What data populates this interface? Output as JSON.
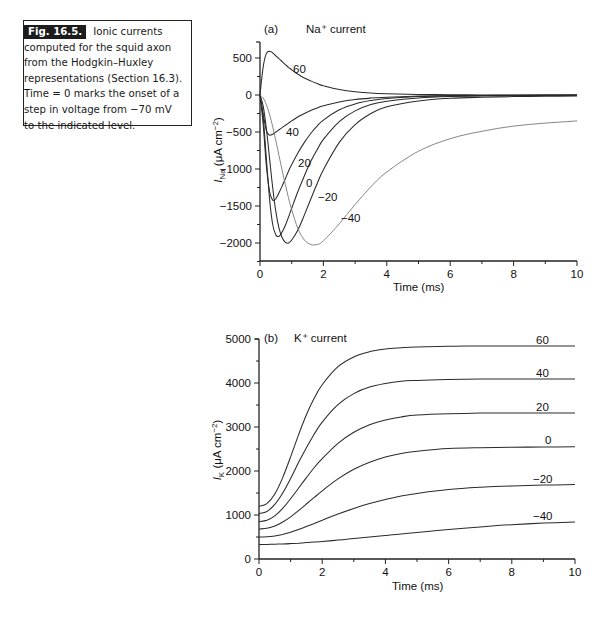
{
  "caption": {
    "figure_label": "Fig. 16.5.",
    "text": "Ionic currents computed for the squid axon from the Hodgkin–Huxley representations (Section 16.3). Time = 0 marks the onset of a step in voltage from −70 mV to the indicated level."
  },
  "chart_data": [
    {
      "id": "a",
      "type": "line",
      "panel_label": "(a)",
      "title": "Na⁺ current",
      "xlabel": "Time (ms)",
      "ylabel": "I_Na (μA cm⁻²)",
      "xlim": [
        0,
        10
      ],
      "ylim": [
        -2300,
        750
      ],
      "xticks": [
        0,
        2,
        4,
        6,
        8,
        10
      ],
      "yticks": [
        500,
        0,
        -500,
        -1000,
        -1500,
        -2000
      ],
      "grid": false,
      "legend": "inline curve labels",
      "x": [
        0,
        0.1,
        0.2,
        0.3,
        0.4,
        0.5,
        0.6,
        0.7,
        0.8,
        0.9,
        1.0,
        1.2,
        1.4,
        1.6,
        1.8,
        2.0,
        2.5,
        3.0,
        3.5,
        4.0,
        5.0,
        6.0,
        7.0,
        8.0,
        9.0,
        10.0
      ],
      "series": [
        {
          "name": "60",
          "values": [
            0,
            380,
            560,
            590,
            570,
            530,
            490,
            450,
            410,
            375,
            340,
            280,
            230,
            190,
            155,
            125,
            75,
            45,
            28,
            18,
            8,
            4,
            2,
            1,
            0,
            0
          ]
        },
        {
          "name": "40",
          "values": [
            0,
            -250,
            -480,
            -540,
            -530,
            -500,
            -470,
            -440,
            -410,
            -380,
            -350,
            -295,
            -250,
            -210,
            -175,
            -145,
            -95,
            -62,
            -42,
            -30,
            -15,
            -8,
            -5,
            -3,
            -2,
            -1
          ]
        },
        {
          "name": "20",
          "values": [
            0,
            -400,
            -950,
            -1300,
            -1420,
            -1400,
            -1320,
            -1230,
            -1130,
            -1030,
            -940,
            -780,
            -640,
            -520,
            -420,
            -340,
            -200,
            -120,
            -75,
            -48,
            -22,
            -12,
            -7,
            -5,
            -3,
            -2
          ]
        },
        {
          "name": "0",
          "values": [
            0,
            -300,
            -850,
            -1400,
            -1750,
            -1890,
            -1910,
            -1850,
            -1760,
            -1650,
            -1530,
            -1300,
            -1090,
            -900,
            -740,
            -600,
            -360,
            -215,
            -130,
            -85,
            -40,
            -22,
            -14,
            -9,
            -6,
            -5
          ]
        },
        {
          "name": "-20",
          "values": [
            0,
            -150,
            -450,
            -850,
            -1250,
            -1580,
            -1800,
            -1930,
            -1990,
            -2000,
            -1960,
            -1820,
            -1620,
            -1410,
            -1200,
            -1010,
            -640,
            -400,
            -250,
            -160,
            -80,
            -45,
            -30,
            -22,
            -18,
            -15
          ]
        },
        {
          "name": "-40",
          "values": [
            0,
            -40,
            -130,
            -260,
            -430,
            -620,
            -820,
            -1020,
            -1210,
            -1390,
            -1550,
            -1810,
            -1960,
            -2020,
            -2020,
            -1970,
            -1740,
            -1480,
            -1240,
            -1040,
            -760,
            -590,
            -490,
            -420,
            -380,
            -350
          ]
        }
      ]
    },
    {
      "id": "b",
      "type": "line",
      "panel_label": "(b)",
      "title": "K⁺ current",
      "xlabel": "Time (ms)",
      "ylabel": "I_K (μA cm⁻²)",
      "xlim": [
        0,
        10
      ],
      "ylim": [
        0,
        5000
      ],
      "xticks": [
        0,
        2,
        4,
        6,
        8,
        10
      ],
      "yticks": [
        0,
        1000,
        2000,
        3000,
        4000,
        5000
      ],
      "grid": false,
      "legend": "inline curve labels",
      "x": [
        0,
        0.25,
        0.5,
        0.75,
        1.0,
        1.25,
        1.5,
        1.75,
        2.0,
        2.5,
        3.0,
        3.5,
        4.0,
        4.5,
        5.0,
        6.0,
        7.0,
        8.0,
        9.0,
        10.0
      ],
      "series": [
        {
          "name": "60",
          "values": [
            1200,
            1260,
            1480,
            1850,
            2320,
            2820,
            3280,
            3660,
            3960,
            4370,
            4590,
            4710,
            4770,
            4800,
            4820,
            4835,
            4840,
            4840,
            4840,
            4840
          ]
        },
        {
          "name": "40",
          "values": [
            1030,
            1080,
            1240,
            1500,
            1830,
            2190,
            2530,
            2840,
            3110,
            3510,
            3760,
            3910,
            3990,
            4040,
            4060,
            4080,
            4090,
            4090,
            4090,
            4090
          ]
        },
        {
          "name": "20",
          "values": [
            850,
            880,
            980,
            1150,
            1370,
            1610,
            1850,
            2080,
            2280,
            2630,
            2880,
            3050,
            3160,
            3230,
            3270,
            3300,
            3315,
            3320,
            3320,
            3320
          ]
        },
        {
          "name": "0",
          "values": [
            680,
            700,
            750,
            840,
            960,
            1100,
            1250,
            1400,
            1550,
            1820,
            2040,
            2200,
            2320,
            2400,
            2450,
            2510,
            2530,
            2540,
            2545,
            2550
          ]
        },
        {
          "name": "-20",
          "values": [
            500,
            505,
            525,
            560,
            610,
            670,
            740,
            810,
            880,
            1020,
            1150,
            1260,
            1350,
            1430,
            1490,
            1580,
            1630,
            1660,
            1680,
            1690
          ]
        },
        {
          "name": "-40",
          "values": [
            330,
            332,
            336,
            342,
            350,
            360,
            372,
            385,
            398,
            430,
            465,
            500,
            535,
            570,
            605,
            670,
            730,
            780,
            815,
            840
          ]
        }
      ]
    }
  ],
  "curve_labels": {
    "a": [
      {
        "text": "60",
        "x": 293,
        "y": 73
      },
      {
        "text": "40",
        "x": 286,
        "y": 136
      },
      {
        "text": "20",
        "x": 298,
        "y": 167
      },
      {
        "text": "0",
        "x": 306,
        "y": 187
      },
      {
        "text": "−20",
        "x": 318,
        "y": 201
      },
      {
        "text": "−40",
        "x": 341,
        "y": 222
      }
    ],
    "b": [
      {
        "text": "60",
        "x": 536,
        "y": 344
      },
      {
        "text": "40",
        "x": 536,
        "y": 377
      },
      {
        "text": "20",
        "x": 536,
        "y": 411
      },
      {
        "text": "0",
        "x": 545,
        "y": 444
      },
      {
        "text": "−20",
        "x": 533,
        "y": 483
      },
      {
        "text": "−40",
        "x": 533,
        "y": 520
      }
    ]
  }
}
